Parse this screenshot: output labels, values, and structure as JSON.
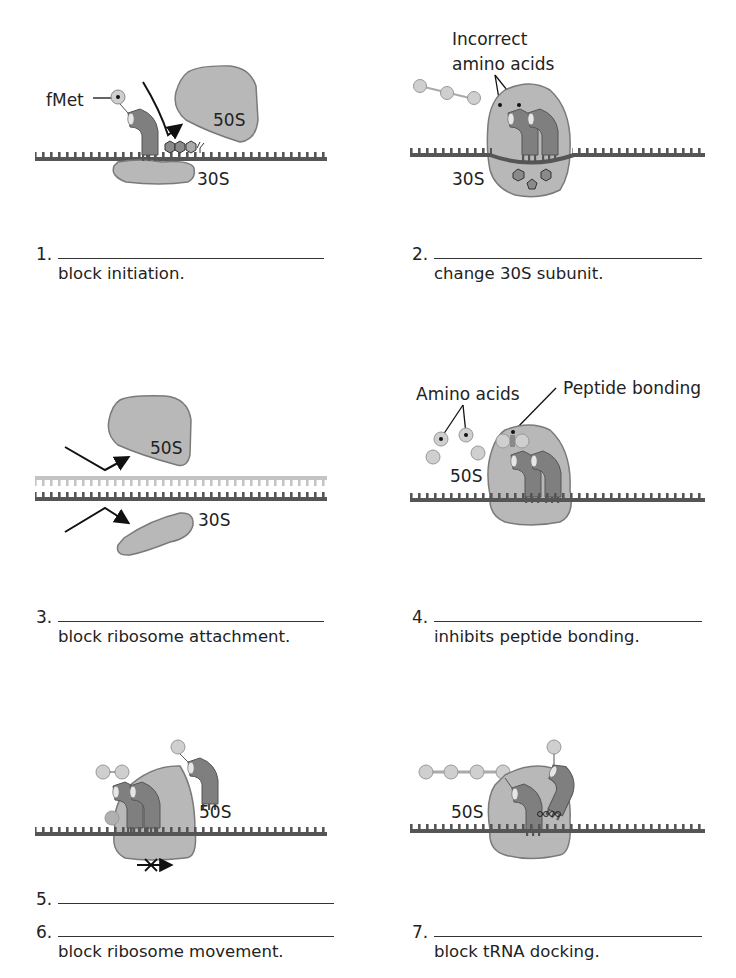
{
  "colors": {
    "ribosome_fill": "#b8b8b8",
    "ribosome_stroke": "#7a7a7a",
    "mrna": "#555555",
    "mrna_light": "#c4c4c4",
    "trna": "#7f7f7f",
    "amino_acid": "#cfcfcf",
    "antibiotic_outline": "#333333"
  },
  "panels": [
    {
      "number": "1.",
      "caption": "block initiation.",
      "labels": {
        "fmet": "fMet",
        "large_subunit": "50S",
        "small_subunit": "30S"
      }
    },
    {
      "number": "2.",
      "caption": "change 30S subunit.",
      "labels": {
        "incorrect_line1": "Incorrect",
        "incorrect_line2": "amino acids",
        "small_subunit": "30S"
      }
    },
    {
      "number": "3.",
      "caption": "block ribosome attachment.",
      "labels": {
        "large_subunit": "50S",
        "small_subunit": "30S"
      }
    },
    {
      "number": "4.",
      "caption": "inhibits peptide bonding.",
      "labels": {
        "amino_acids": "Amino acids",
        "peptide_bonding": "Peptide bonding",
        "large_subunit": "50S"
      }
    },
    {
      "number": "5.",
      "caption": "",
      "labels": {
        "large_subunit": "50S"
      }
    },
    {
      "number": "6.",
      "caption": "block ribosome movement.",
      "labels": {}
    },
    {
      "number": "7.",
      "caption": "block tRNA docking.",
      "labels": {
        "large_subunit": "50S"
      }
    }
  ]
}
